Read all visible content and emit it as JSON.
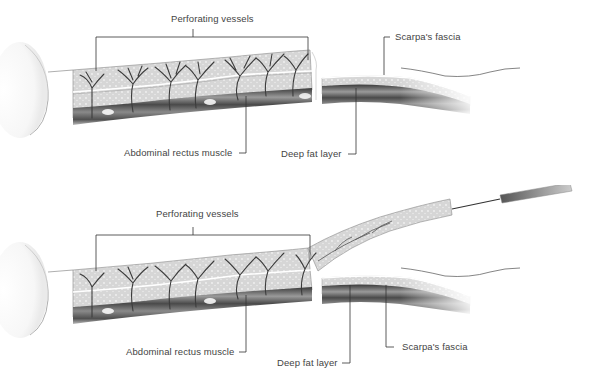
{
  "figure": {
    "panels": [
      {
        "id": "top",
        "description": "Abdominal wall cross-section with perforating vessels",
        "labels": {
          "perforating_vessels": "Perforating vessels",
          "scarpas_fascia": "Scarpa's fascia",
          "abdominal_rectus_muscle": "Abdominal rectus muscle",
          "deep_fat_layer": "Deep fat layer"
        }
      },
      {
        "id": "bottom",
        "description": "Flap elevated above Scarpa's fascia with surgical instrument",
        "labels": {
          "perforating_vessels": "Perforating vessels",
          "abdominal_rectus_muscle": "Abdominal rectus muscle",
          "deep_fat_layer": "Deep fat layer",
          "scarpas_fascia": "Scarpa's fascia"
        }
      }
    ],
    "colors": {
      "fat_fill": "#d9d9d9",
      "muscle_dark": "#555555",
      "vessel": "#444444",
      "leader_line": "#333333",
      "label_text": "#444444"
    }
  }
}
